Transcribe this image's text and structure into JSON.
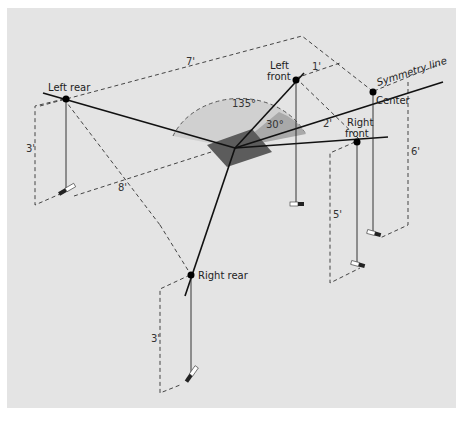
{
  "diagram": {
    "labels": {
      "left_rear": "Left rear",
      "left_front_1": "Left",
      "left_front_2": "front",
      "right_front_1": "Right",
      "right_front_2": "front",
      "center": "Center",
      "right_rear": "Right rear",
      "symmetry": "Symmetry line"
    },
    "angles": {
      "wide": "135°",
      "narrow": "30°"
    },
    "dimensions": {
      "d7": "7'",
      "d1": "1'",
      "d2": "2'",
      "d8": "8'",
      "d3_left": "3'",
      "d3_right": "3'",
      "d5": "5'",
      "d6": "6'"
    },
    "colors": {
      "background": "#e4e4e4",
      "wedge_wide": "#cfcfcf",
      "wedge_narrow": "#a8a8a8",
      "listener": "#5a5a5a",
      "line": "#111111"
    }
  }
}
